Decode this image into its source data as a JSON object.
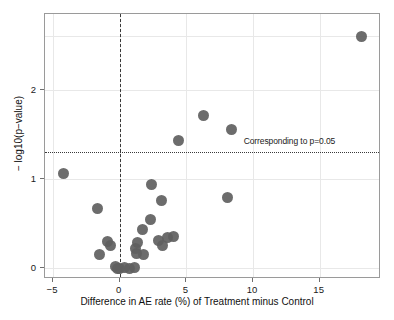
{
  "chart_data": {
    "type": "scatter",
    "title": "",
    "xlabel": "Difference in AE rate (%) of Treatment minus Control",
    "ylabel": "− log10(p−value)",
    "xlim": [
      -5.6,
      19.6
    ],
    "ylim": [
      -0.12,
      2.85
    ],
    "xticks": [
      -5,
      0,
      5,
      10,
      15
    ],
    "xticklabels": [
      "−5",
      "0",
      "5",
      "10",
      "15"
    ],
    "yticks": [
      0,
      1,
      2
    ],
    "yticklabels": [
      "0",
      "1",
      "2"
    ],
    "grid": true,
    "legend": null,
    "marker_color": "#5f5f5f",
    "reference_lines": [
      {
        "name": "null-effect-vline",
        "orientation": "vertical",
        "value": 0,
        "style": "dashed",
        "color": "#3a3a3a",
        "label": ""
      },
      {
        "name": "significance-hline",
        "orientation": "horizontal",
        "value": 1.301,
        "style": "dotted",
        "color": "#3a3a3a",
        "label": "Corresponding to p=0.05"
      }
    ],
    "annotations": [
      {
        "text": "Corresponding to p=0.05",
        "x": 9.3,
        "y": 1.41
      }
    ],
    "points": [
      {
        "x": 18.1,
        "y": 2.6
      },
      {
        "x": 6.3,
        "y": 1.71
      },
      {
        "x": 8.4,
        "y": 1.55
      },
      {
        "x": 4.4,
        "y": 1.43
      },
      {
        "x": -4.2,
        "y": 1.06
      },
      {
        "x": 2.4,
        "y": 0.94
      },
      {
        "x": 8.1,
        "y": 0.79
      },
      {
        "x": 3.1,
        "y": 0.76
      },
      {
        "x": -1.7,
        "y": 0.67
      },
      {
        "x": 2.3,
        "y": 0.55
      },
      {
        "x": 1.7,
        "y": 0.44
      },
      {
        "x": 4.0,
        "y": 0.36
      },
      {
        "x": 3.6,
        "y": 0.34
      },
      {
        "x": -0.9,
        "y": 0.3
      },
      {
        "x": -0.7,
        "y": 0.26
      },
      {
        "x": 1.3,
        "y": 0.29
      },
      {
        "x": 2.9,
        "y": 0.31
      },
      {
        "x": 3.2,
        "y": 0.26
      },
      {
        "x": 1.2,
        "y": 0.22
      },
      {
        "x": 1.25,
        "y": 0.17
      },
      {
        "x": 1.8,
        "y": 0.15
      },
      {
        "x": -1.5,
        "y": 0.15
      },
      {
        "x": -0.35,
        "y": 0.02
      },
      {
        "x": 0.0,
        "y": 0.0
      },
      {
        "x": 0.35,
        "y": 0.01
      },
      {
        "x": 0.75,
        "y": 0.0
      },
      {
        "x": 1.1,
        "y": 0.01
      },
      {
        "x": -0.15,
        "y": 0.0
      }
    ]
  },
  "axis": {
    "x_tick_labels": [
      "−5",
      "0",
      "5",
      "10",
      "15"
    ],
    "y_tick_labels": [
      "0",
      "1",
      "2"
    ],
    "x_title": "Difference in AE rate (%) of Treatment minus Control",
    "y_title": "− log10(p−value)"
  },
  "annotation": {
    "p_threshold_label": "Corresponding to p=0.05"
  }
}
